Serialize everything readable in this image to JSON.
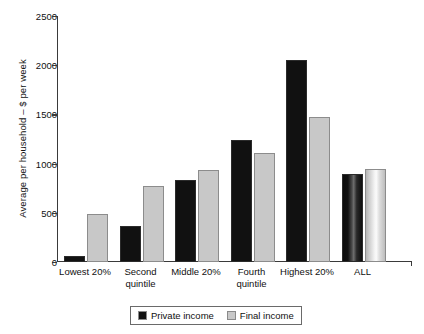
{
  "chart_data": {
    "type": "bar",
    "title": "",
    "xlabel": "",
    "ylabel": "Average per household – $ per week",
    "ylim": [
      0,
      2500
    ],
    "yticks": [
      0,
      500,
      1000,
      1500,
      2000,
      2500
    ],
    "grid": false,
    "legend_position": "bottom-center",
    "categories": [
      "Lowest 20%",
      "Second quintile",
      "Middle 20%",
      "Fourth quintile",
      "Highest 20%",
      "ALL"
    ],
    "series": [
      {
        "name": "Private income",
        "color": "#111111",
        "values": [
          60,
          370,
          830,
          1240,
          2050,
          890
        ]
      },
      {
        "name": "Final income",
        "color": "#c8c8c8",
        "values": [
          490,
          770,
          940,
          1105,
          1475,
          950
        ]
      }
    ]
  },
  "axis": {
    "y_title": "Average per household – $ per week",
    "y_tick_labels": [
      "0",
      "500",
      "1000",
      "1500",
      "2000",
      "2500"
    ]
  },
  "x_labels": [
    {
      "line1": "Lowest 20%",
      "line2": ""
    },
    {
      "line1": "Second",
      "line2": "quintile"
    },
    {
      "line1": "Middle 20%",
      "line2": ""
    },
    {
      "line1": "Fourth",
      "line2": "quintile"
    },
    {
      "line1": "Highest 20%",
      "line2": ""
    },
    {
      "line1": "ALL",
      "line2": ""
    }
  ],
  "legend": {
    "items": [
      {
        "label": "Private income",
        "color": "#111111"
      },
      {
        "label": "Final income",
        "color": "#c8c8c8"
      }
    ]
  }
}
